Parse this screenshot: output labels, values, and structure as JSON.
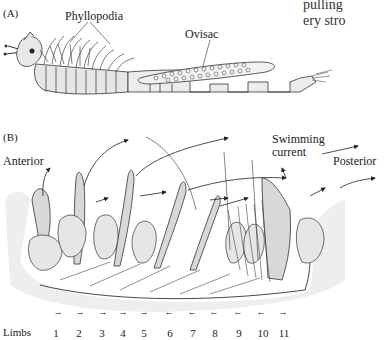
{
  "figure": {
    "panel_a": {
      "label": "(A)",
      "annotations": {
        "phyllopodia": "Phyllopodia",
        "ovisac": "Ovisac"
      }
    },
    "panel_b": {
      "label": "(B)",
      "annotations": {
        "anterior": "Anterior",
        "swimming_current_line1": "Swimming",
        "swimming_current_line2": "current",
        "posterior": "Posterior"
      },
      "limbs_label": "Limbs",
      "limbs": [
        {
          "n": "1",
          "arrow": "→"
        },
        {
          "n": "2",
          "arrow": "→"
        },
        {
          "n": "3",
          "arrow": "→"
        },
        {
          "n": "4",
          "arrow": "→"
        },
        {
          "n": "5",
          "arrow": "→"
        },
        {
          "n": "6",
          "arrow": "←"
        },
        {
          "n": "7",
          "arrow": "←"
        },
        {
          "n": "8",
          "arrow": "←"
        },
        {
          "n": "9",
          "arrow": "←"
        },
        {
          "n": "10",
          "arrow": "←"
        },
        {
          "n": "11",
          "arrow": "→"
        }
      ]
    },
    "cut_text": {
      "line1": "pulling",
      "line2": "ery stro"
    }
  }
}
